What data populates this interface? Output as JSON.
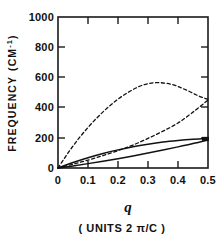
{
  "chart_data": {
    "type": "line",
    "title": "",
    "xlabel": "q",
    "xlabel_units": "( UNITS 2 π/C )",
    "ylabel": "FREQUENCY",
    "ylabel_units": "(CM",
    "ylabel_units_exp": "-1",
    "ylabel_units_close": ")",
    "xlim": [
      0,
      0.5
    ],
    "ylim": [
      0,
      1000
    ],
    "xticks": [
      0,
      0.1,
      0.2,
      0.3,
      0.4,
      0.5
    ],
    "xtick_labels": [
      "0",
      "0.1",
      "0.2",
      "0.3",
      "0.4",
      "0.5"
    ],
    "yticks": [
      0,
      200,
      400,
      600,
      800,
      1000
    ],
    "ytick_labels": [
      "0",
      "200",
      "400",
      "600",
      "800",
      "1000"
    ],
    "grid": false,
    "legend": "none",
    "frame": "box-all-sides-inward-ticks",
    "series": [
      {
        "name": "optic-branch-dashed",
        "style": "dashed",
        "color": "#111111",
        "x": [
          0.0,
          0.02,
          0.04,
          0.06,
          0.08,
          0.1,
          0.12,
          0.14,
          0.16,
          0.18,
          0.2,
          0.22,
          0.24,
          0.26,
          0.28,
          0.3,
          0.32,
          0.34,
          0.36,
          0.38,
          0.4,
          0.42,
          0.44,
          0.46,
          0.48,
          0.5
        ],
        "values": [
          0,
          60,
          118,
          172,
          222,
          268,
          312,
          352,
          390,
          424,
          456,
          484,
          508,
          530,
          547,
          558,
          564,
          565,
          561,
          553,
          540,
          523,
          505,
          485,
          468,
          455
        ]
      },
      {
        "name": "acoustic-branch-dashed",
        "style": "dashed",
        "color": "#111111",
        "x": [
          0.0,
          0.05,
          0.1,
          0.15,
          0.2,
          0.25,
          0.3,
          0.35,
          0.4,
          0.45,
          0.5
        ],
        "values": [
          0,
          25,
          52,
          82,
          115,
          152,
          196,
          244,
          298,
          370,
          450
        ]
      },
      {
        "name": "upper-solid-branch",
        "style": "solid",
        "color": "#111111",
        "x": [
          0.0,
          0.05,
          0.1,
          0.15,
          0.2,
          0.25,
          0.3,
          0.35,
          0.4,
          0.45,
          0.5
        ],
        "values": [
          0,
          36,
          68,
          96,
          120,
          141,
          158,
          172,
          182,
          190,
          196
        ]
      },
      {
        "name": "lower-solid-branch",
        "style": "solid",
        "color": "#111111",
        "x": [
          0.0,
          0.05,
          0.1,
          0.15,
          0.2,
          0.25,
          0.3,
          0.35,
          0.4,
          0.45,
          0.5
        ],
        "values": [
          0,
          14,
          29,
          45,
          62,
          80,
          99,
          119,
          140,
          162,
          186
        ]
      }
    ],
    "markers": [
      {
        "name": "endpoint-marker",
        "x": 0.5,
        "y": 193
      }
    ]
  }
}
